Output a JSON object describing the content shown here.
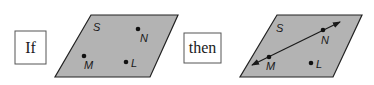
{
  "diagram": {
    "left_box": {
      "label": "If"
    },
    "right_box": {
      "label": "then"
    },
    "left_plane": {
      "name": "S",
      "points": {
        "N": "N",
        "M": "M",
        "L": "L"
      },
      "fill": "#b3b3b3"
    },
    "right_plane": {
      "name": "S",
      "points": {
        "N": "N",
        "M": "M",
        "L": "L"
      },
      "line_through": [
        "M",
        "N"
      ],
      "fill": "#b3b3b3"
    }
  }
}
